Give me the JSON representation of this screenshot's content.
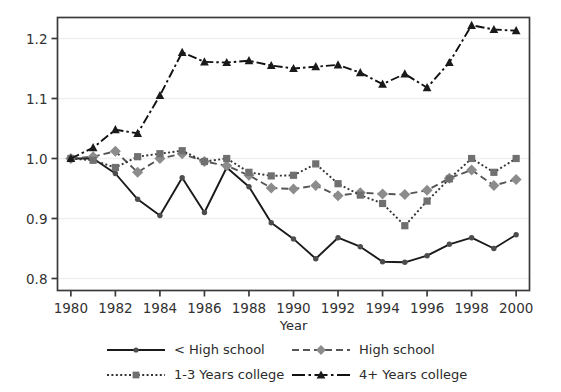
{
  "chart_data": {
    "type": "line",
    "title": "",
    "xlabel": "Year",
    "ylabel": "",
    "xlim": [
      1979.4,
      2000.6
    ],
    "ylim": [
      0.78,
      1.235
    ],
    "xticks": [
      1980,
      1982,
      1984,
      1986,
      1988,
      1990,
      1992,
      1994,
      1996,
      1998,
      2000
    ],
    "xticklabels": [
      "1980",
      "1982",
      "1984",
      "1986",
      "1988",
      "1990",
      "1992",
      "1994",
      "1996",
      "1998",
      "2000"
    ],
    "yticks": [
      0.8,
      0.9,
      1.0,
      1.1,
      1.2
    ],
    "yticklabels": [
      "0.8",
      "0.9",
      "1.0",
      "1.1",
      "1.2"
    ],
    "grid": "horizontal-light",
    "legend_position": "below-axes",
    "x": [
      1980,
      1981,
      1982,
      1983,
      1984,
      1985,
      1986,
      1987,
      1988,
      1989,
      1990,
      1991,
      1992,
      1993,
      1994,
      1995,
      1996,
      1997,
      1998,
      1999,
      2000
    ],
    "series": [
      {
        "name": "< High school",
        "line": "solid",
        "marker": "circle",
        "color": "#1a1a1a",
        "marker_color": "#4d4d4d",
        "values": [
          1.0,
          1.0,
          0.975,
          0.932,
          0.905,
          0.968,
          0.91,
          0.985,
          0.953,
          0.893,
          0.866,
          0.833,
          0.868,
          0.853,
          0.828,
          0.827,
          0.838,
          0.857,
          0.868,
          0.85,
          0.873
        ]
      },
      {
        "name": "High school",
        "line": "dashed",
        "marker": "diamond",
        "color": "#555555",
        "marker_color": "#8c8c8c",
        "values": [
          1.0,
          1.003,
          1.012,
          0.977,
          1.0,
          1.008,
          0.995,
          0.988,
          0.972,
          0.951,
          0.949,
          0.955,
          0.938,
          0.943,
          0.941,
          0.94,
          0.947,
          0.967,
          0.981,
          0.955,
          0.965
        ]
      },
      {
        "name": "1-3 Years college",
        "line": "dotted",
        "marker": "square",
        "color": "#333333",
        "marker_color": "#707070",
        "values": [
          1.0,
          0.997,
          0.985,
          1.003,
          1.008,
          1.013,
          0.995,
          1.0,
          0.977,
          0.971,
          0.972,
          0.991,
          0.958,
          0.939,
          0.925,
          0.888,
          0.929,
          0.966,
          1.0,
          0.977,
          1.0
        ]
      },
      {
        "name": "4+ Years college",
        "line": "dash-dot",
        "marker": "triangle",
        "color": "#111111",
        "marker_color": "#1a1a1a",
        "values": [
          1.0,
          1.018,
          1.048,
          1.042,
          1.105,
          1.177,
          1.161,
          1.16,
          1.163,
          1.155,
          1.15,
          1.153,
          1.156,
          1.143,
          1.124,
          1.141,
          1.118,
          1.16,
          1.222,
          1.215,
          1.213
        ]
      }
    ]
  },
  "legend": {
    "entries": [
      {
        "label": "< High school"
      },
      {
        "label": "High school"
      },
      {
        "label": "1-3 Years college"
      },
      {
        "label": "4+ Years college"
      }
    ]
  }
}
